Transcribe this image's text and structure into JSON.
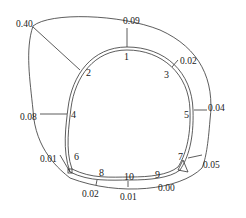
{
  "diagram": {
    "type": "closed-loop route with offset values",
    "nodes": [
      {
        "id": "1",
        "label": "1"
      },
      {
        "id": "2",
        "label": "2"
      },
      {
        "id": "3",
        "label": "3"
      },
      {
        "id": "4",
        "label": "4"
      },
      {
        "id": "5",
        "label": "5"
      },
      {
        "id": "6",
        "label": "6"
      },
      {
        "id": "7",
        "label": "7"
      },
      {
        "id": "8",
        "label": "8"
      },
      {
        "id": "9",
        "label": "9"
      },
      {
        "id": "10",
        "label": "10"
      }
    ],
    "values": [
      {
        "node": "1",
        "value": "0.09"
      },
      {
        "node": "2",
        "value": "0.40"
      },
      {
        "node": "3",
        "value": "0.02"
      },
      {
        "node": "4",
        "value": "0.08"
      },
      {
        "node": "5",
        "value": "0.04"
      },
      {
        "node": "6",
        "value": "0.01"
      },
      {
        "node": "7",
        "value": "0.05"
      },
      {
        "node": "8",
        "value": "0.02"
      },
      {
        "node": "9",
        "value": "0.00"
      },
      {
        "node": "10",
        "value": "0.01"
      }
    ]
  }
}
